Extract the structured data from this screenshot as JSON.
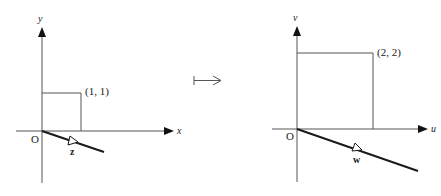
{
  "diagram": {
    "type": "linear-map-illustration",
    "colors": {
      "axis": "#555555",
      "square": "#555555",
      "vector_line": "#1a1a1a",
      "text": "#222222"
    },
    "map_symbol": "↦",
    "left_panel": {
      "x_axis_label": "x",
      "y_axis_label": "y",
      "origin_label": "O",
      "corner_label": "(1, 1)",
      "vector_label": "z"
    },
    "right_panel": {
      "x_axis_label": "u",
      "y_axis_label": "v",
      "origin_label": "O",
      "corner_label": "(2, 2)",
      "vector_label": "w"
    }
  }
}
